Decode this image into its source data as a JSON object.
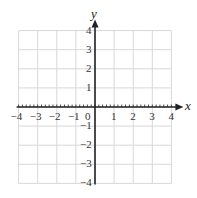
{
  "chart_data": {
    "type": "scatter",
    "title": "",
    "xlabel": "x",
    "ylabel": "y",
    "xlim": [
      -4,
      4
    ],
    "ylim": [
      -4,
      4
    ],
    "grid": true,
    "legend": null,
    "x_ticks": [
      "-4",
      "-3",
      "-2",
      "-1",
      "0",
      "1",
      "2",
      "3",
      "4"
    ],
    "y_ticks": [
      "4",
      "3",
      "2",
      "1",
      "-1",
      "-2",
      "-3",
      "-4"
    ],
    "x_minor_ticks_per_unit": 5,
    "series": []
  },
  "labels": {
    "x_axis": "x",
    "y_axis": "y",
    "x_ticks": [
      {
        "v": -4,
        "t": "−4"
      },
      {
        "v": -3,
        "t": "−3"
      },
      {
        "v": -2,
        "t": "−2"
      },
      {
        "v": -1,
        "t": "−1"
      },
      {
        "v": 0,
        "t": "0"
      },
      {
        "v": 1,
        "t": "1"
      },
      {
        "v": 2,
        "t": "2"
      },
      {
        "v": 3,
        "t": "3"
      },
      {
        "v": 4,
        "t": "4"
      }
    ],
    "y_ticks": [
      {
        "v": 4,
        "t": "4"
      },
      {
        "v": 3,
        "t": "3"
      },
      {
        "v": 2,
        "t": "2"
      },
      {
        "v": 1,
        "t": "1"
      },
      {
        "v": -1,
        "t": "−1"
      },
      {
        "v": -2,
        "t": "−2"
      },
      {
        "v": -3,
        "t": "−3"
      },
      {
        "v": -4,
        "t": "−4"
      }
    ]
  },
  "colors": {
    "grid": "#d8d8d8",
    "axis": "#222222",
    "text": "#333333"
  }
}
